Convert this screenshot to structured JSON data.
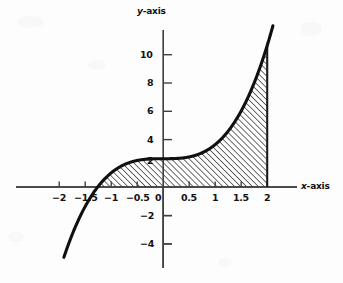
{
  "chart_data": {
    "type": "line",
    "title": "",
    "subtitle": "",
    "xlabel": "x-axis",
    "ylabel": "y-axis",
    "function": "y = x^3 + 2",
    "xlim": [
      -2.35,
      2.55
    ],
    "ylim": [
      -5.3,
      12.3
    ],
    "grid": false,
    "legend": null,
    "x_ticks": [
      -2,
      -1.5,
      -1,
      -0.5,
      0,
      0.5,
      1,
      1.5,
      2
    ],
    "x_tick_labels": [
      "−2",
      "−1.5",
      "−1",
      "−0.5",
      "0",
      "0.5",
      "1",
      "1.5",
      "2"
    ],
    "y_ticks": [
      -4,
      -2,
      2,
      4,
      6,
      8,
      10
    ],
    "y_tick_labels": [
      "−4",
      "−2",
      "2",
      "4",
      "6",
      "8",
      "10"
    ],
    "series": [
      {
        "name": "y = x^3 + 2",
        "x": [
          -1.75,
          -1.6,
          -1.5,
          -1.4,
          -1.25992,
          -1.1,
          -1.0,
          -0.9,
          -0.75,
          -0.6,
          -0.5,
          -0.4,
          -0.25,
          -0.1,
          0,
          0.1,
          0.25,
          0.4,
          0.5,
          0.6,
          0.75,
          0.9,
          1.0,
          1.1,
          1.25,
          1.4,
          1.5,
          1.6,
          1.75,
          1.9,
          2.0,
          2.08
        ],
        "y": [
          -3.359,
          -2.096,
          -1.375,
          -0.744,
          0.0,
          0.669,
          1.0,
          1.271,
          1.578,
          1.784,
          1.875,
          1.936,
          1.984,
          1.999,
          2.0,
          2.001,
          2.016,
          2.064,
          2.125,
          2.216,
          2.422,
          2.729,
          3.0,
          3.331,
          3.953,
          4.744,
          5.375,
          6.096,
          7.359,
          8.859,
          10.0,
          11.0
        ]
      }
    ],
    "shaded_region": {
      "label": "area under curve",
      "x_from": -1.25992,
      "x_to": 2.0,
      "fill": "diagonal-hatch",
      "bounded_below_by": "x-axis"
    },
    "colors": {
      "curve": "#101010",
      "axis": "#3a3a3a",
      "text": "#111111",
      "background": "#fdfdfd",
      "hatch": "#1a1a1a"
    }
  },
  "labels": {
    "y_axis_title": "y-axis",
    "y_axis_title_var": "y",
    "y_axis_title_rest": "-axis",
    "x_axis_title": "x-axis",
    "x_axis_title_var": "x",
    "x_axis_title_rest": "-axis"
  }
}
